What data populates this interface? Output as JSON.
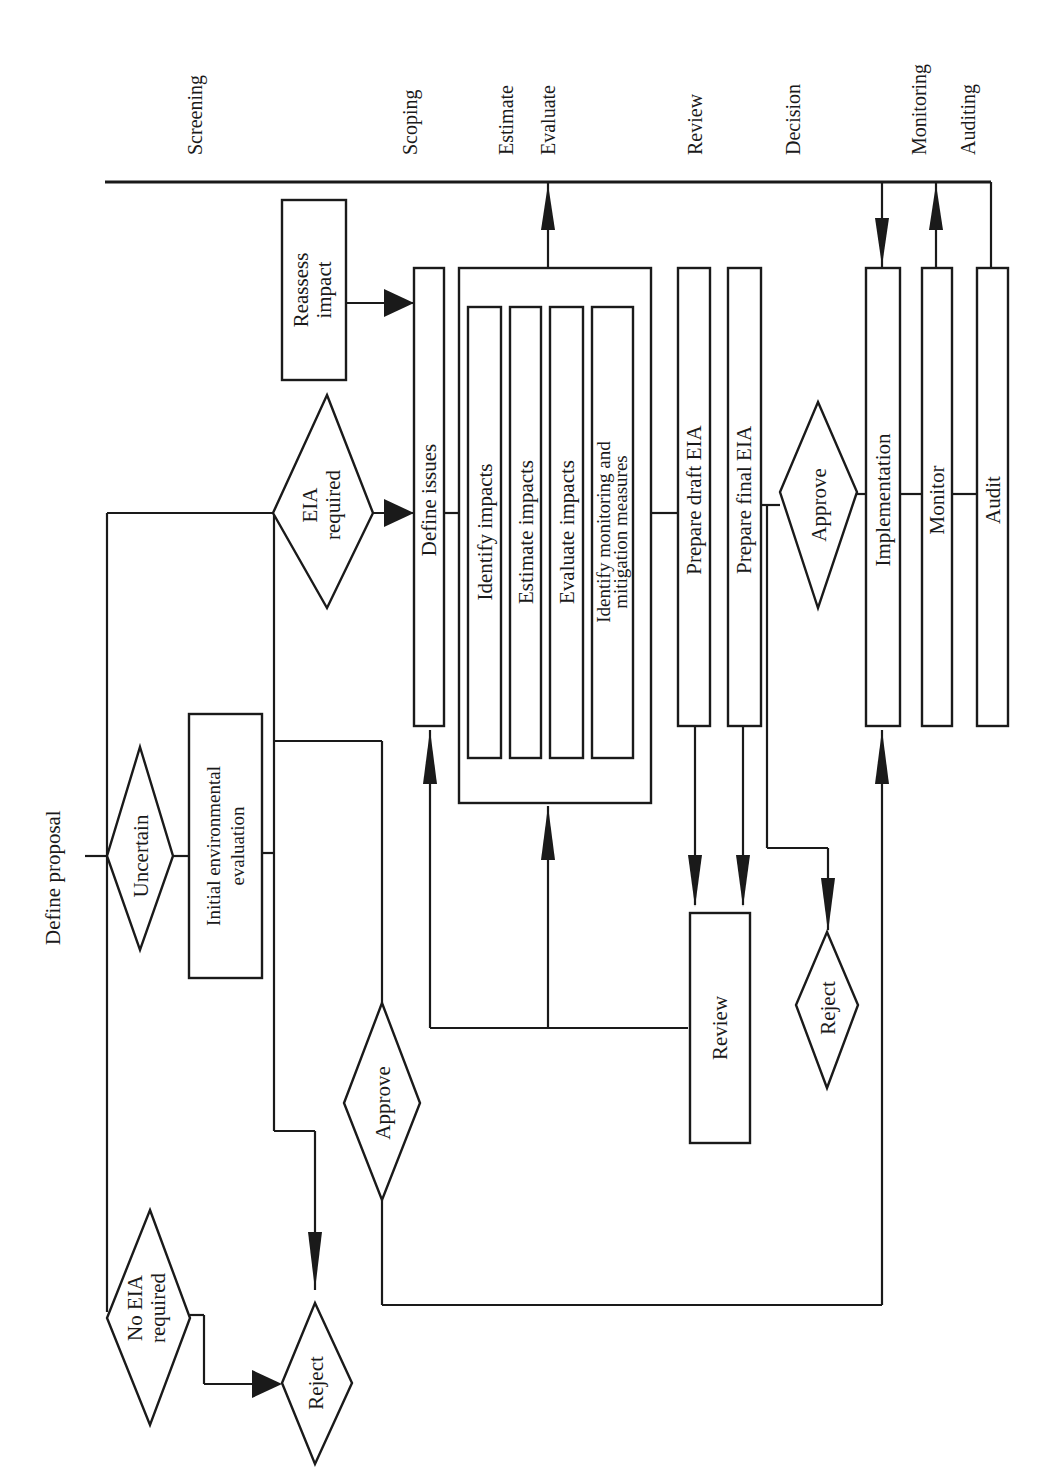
{
  "diagram": {
    "orientation": "rotated-90-ccw",
    "stages": [
      "Screening",
      "Scoping",
      "Estimate",
      "Evaluate",
      "Review",
      "Decision",
      "Monitoring",
      "Auditing"
    ],
    "start": "Define proposal",
    "decisions": {
      "uncertain": "Uncertain",
      "eia_required": [
        "EIA",
        "required"
      ],
      "no_eia_required": [
        "No EIA",
        "required"
      ],
      "approve_early": "Approve",
      "approve_final": "Approve",
      "reject_screening": "Reject",
      "reject_final": "Reject"
    },
    "processes": {
      "initial_evaluation": [
        "Initial environmental",
        "evaluation"
      ],
      "reassess": [
        "Reassess",
        "impact"
      ],
      "define_issues": "Define issues",
      "identify_impacts": "Identify impacts",
      "estimate_impacts": "Estimate impacts",
      "evaluate_impacts": "Evaluate impacts",
      "identify_measures": [
        "Identify monitoring and",
        "mitigation measures"
      ],
      "prepare_draft": "Prepare draft EIA",
      "prepare_final": "Prepare final EIA",
      "review": "Review",
      "implementation": "Implementation",
      "monitor": "Monitor",
      "audit": "Audit"
    }
  }
}
